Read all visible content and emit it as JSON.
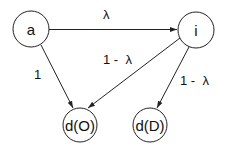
{
  "diagram": {
    "nodes": [
      {
        "id": "a",
        "label": "a",
        "cx": 31,
        "cy": 29,
        "r": 18
      },
      {
        "id": "i",
        "label": "i",
        "cx": 196,
        "cy": 30,
        "r": 18
      },
      {
        "id": "dO",
        "label": "d(O)",
        "cx": 80,
        "cy": 125,
        "r": 17
      },
      {
        "id": "dD",
        "label": "d(D)",
        "cx": 150,
        "cy": 125,
        "r": 17
      }
    ],
    "edges": [
      {
        "from": "a",
        "to": "i",
        "label": "λ"
      },
      {
        "from": "a",
        "to": "dO",
        "label": "1"
      },
      {
        "from": "i",
        "to": "dO",
        "label": "1 -  λ"
      },
      {
        "from": "i",
        "to": "dD",
        "label": "1 -  λ"
      }
    ]
  }
}
